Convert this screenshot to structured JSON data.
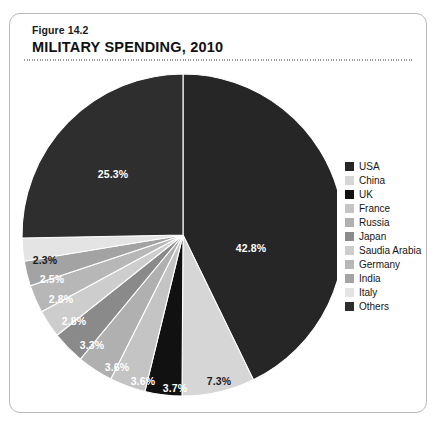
{
  "figure": {
    "number": "Figure 14.2",
    "title": "MILITARY SPENDING, 2010"
  },
  "chart_data": {
    "type": "pie",
    "title": "MILITARY SPENDING, 2010",
    "subtitle": "Figure 14.2",
    "legend_position": "right",
    "units": "percent of total",
    "start_angle_deg": 0,
    "direction": "clockwise",
    "categories": [
      "USA",
      "China",
      "UK",
      "France",
      "Russia",
      "Japan",
      "Saudia Arabia",
      "Germany",
      "India",
      "Italy",
      "Others"
    ],
    "values": [
      42.8,
      7.3,
      3.7,
      3.6,
      3.6,
      3.3,
      2.8,
      2.8,
      2.5,
      2.3,
      25.3
    ],
    "labels": [
      "42.8%",
      "7.3%",
      "3.7%",
      "3.6%",
      "3.6%",
      "3.3%",
      "2.8%",
      "2.8%",
      "2.5%",
      "2.3%",
      "25.3%"
    ],
    "colors": [
      "#262626",
      "#d6d6d6",
      "#111111",
      "#c4c4c4",
      "#b0b0b0",
      "#8a8a8a",
      "#cdcdcd",
      "#b7b7b7",
      "#a3a3a3",
      "#e4e4e4",
      "#2e2e2e"
    ],
    "label_colors": [
      "#ffffff",
      "#1a1a1a",
      "#ffffff",
      "#ffffff",
      "#ffffff",
      "#ffffff",
      "#ffffff",
      "#ffffff",
      "#ffffff",
      "#1a1a1a",
      "#ffffff"
    ],
    "slices": [
      {
        "name": "USA",
        "value": 42.8,
        "label": "42.8%",
        "color": "#262626",
        "label_color": "#ffffff",
        "label_x": 239,
        "label_y": 180
      },
      {
        "name": "China",
        "value": 7.3,
        "label": "7.3%",
        "color": "#d6d6d6",
        "label_color": "#1a1a1a",
        "label_x": 207,
        "label_y": 313
      },
      {
        "name": "UK",
        "value": 3.7,
        "label": "3.7%",
        "color": "#111111",
        "label_color": "#ffffff",
        "label_x": 163,
        "label_y": 320
      },
      {
        "name": "France",
        "value": 3.6,
        "label": "3.6%",
        "color": "#c4c4c4",
        "label_color": "#ffffff",
        "label_x": 131,
        "label_y": 313
      },
      {
        "name": "Russia",
        "value": 3.6,
        "label": "3.6%",
        "color": "#b0b0b0",
        "label_color": "#ffffff",
        "label_x": 105,
        "label_y": 299
      },
      {
        "name": "Japan",
        "value": 3.3,
        "label": "3.3%",
        "color": "#8a8a8a",
        "label_color": "#ffffff",
        "label_x": 80,
        "label_y": 277
      },
      {
        "name": "Saudia Arabia",
        "value": 2.8,
        "label": "2.8%",
        "color": "#cdcdcd",
        "label_color": "#ffffff",
        "label_x": 62,
        "label_y": 253
      },
      {
        "name": "Germany",
        "value": 2.8,
        "label": "2.8%",
        "color": "#b7b7b7",
        "label_color": "#ffffff",
        "label_x": 49,
        "label_y": 231
      },
      {
        "name": "India",
        "value": 2.5,
        "label": "2.5%",
        "color": "#a3a3a3",
        "label_color": "#ffffff",
        "label_x": 40,
        "label_y": 211
      },
      {
        "name": "Italy",
        "value": 2.3,
        "label": "2.3%",
        "color": "#e4e4e4",
        "label_color": "#1a1a1a",
        "label_x": 33,
        "label_y": 192
      },
      {
        "name": "Others",
        "value": 25.3,
        "label": "25.3%",
        "color": "#2e2e2e",
        "label_color": "#ffffff",
        "label_x": 101,
        "label_y": 106
      }
    ]
  },
  "legend": {
    "items": [
      {
        "label": "USA",
        "color": "#262626"
      },
      {
        "label": "China",
        "color": "#d6d6d6"
      },
      {
        "label": "UK",
        "color": "#111111"
      },
      {
        "label": "France",
        "color": "#c4c4c4"
      },
      {
        "label": "Russia",
        "color": "#b0b0b0"
      },
      {
        "label": "Japan",
        "color": "#8a8a8a"
      },
      {
        "label": "Saudia Arabia",
        "color": "#cdcdcd"
      },
      {
        "label": "Germany",
        "color": "#b7b7b7"
      },
      {
        "label": "India",
        "color": "#a3a3a3"
      },
      {
        "label": "Italy",
        "color": "#e4e4e4"
      },
      {
        "label": "Others",
        "color": "#2e2e2e"
      }
    ]
  }
}
